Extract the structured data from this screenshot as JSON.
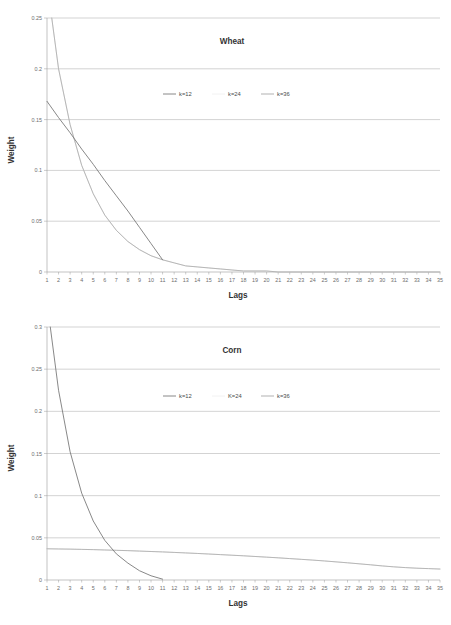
{
  "colors": {
    "series_k12": "#7a7a7a",
    "series_k24": "#d9d9d9",
    "series_k36": "#a8a8a8",
    "gridline": "#a6a6a6",
    "axis": "#9a9a9a",
    "text": "#333333",
    "tick_text": "#6d6d6d",
    "background": "#ffffff"
  },
  "charts": [
    {
      "id": "wheat",
      "title": "Wheat",
      "xlabel": "Lags",
      "ylabel": "Weight",
      "ylim": [
        0,
        0.25
      ],
      "yticks": [
        "0",
        "0.05",
        "0.1",
        "0.15",
        "0.2",
        "0.25"
      ],
      "ytick_values": [
        0,
        0.05,
        0.1,
        0.15,
        0.2,
        0.25
      ],
      "xticks": [
        "1",
        "2",
        "3",
        "4",
        "5",
        "6",
        "7",
        "8",
        "9",
        "10",
        "11",
        "12",
        "13",
        "14",
        "15",
        "16",
        "17",
        "18",
        "19",
        "20",
        "21",
        "22",
        "23",
        "24",
        "25",
        "26",
        "27",
        "28",
        "29",
        "30",
        "31",
        "32",
        "33",
        "34",
        "35"
      ],
      "legend": [
        {
          "label": "k=12",
          "swatch": true
        },
        {
          "label": "k=24",
          "swatch": false
        },
        {
          "label": "k=36",
          "swatch": true
        }
      ]
    },
    {
      "id": "corn",
      "title": "Corn",
      "xlabel": "Lags",
      "ylabel": "Weight",
      "ylim": [
        0,
        0.3
      ],
      "yticks": [
        "0",
        "0.05",
        "0.1",
        "0.15",
        "0.2",
        "0.25",
        "0.3"
      ],
      "ytick_values": [
        0,
        0.05,
        0.1,
        0.15,
        0.2,
        0.25,
        0.3
      ],
      "xticks": [
        "1",
        "2",
        "3",
        "4",
        "5",
        "6",
        "7",
        "8",
        "9",
        "10",
        "11",
        "12",
        "13",
        "14",
        "15",
        "16",
        "17",
        "18",
        "19",
        "20",
        "21",
        "22",
        "23",
        "24",
        "25",
        "26",
        "27",
        "28",
        "29",
        "30",
        "31",
        "32",
        "33",
        "34",
        "35"
      ],
      "legend": [
        {
          "label": "k=12",
          "swatch": true
        },
        {
          "label": "K=24",
          "swatch": false
        },
        {
          "label": "k=36",
          "swatch": true
        }
      ]
    }
  ],
  "chart_data": [
    {
      "type": "line",
      "title": "Wheat",
      "xlabel": "Lags",
      "ylabel": "Weight",
      "ylim": [
        0,
        0.25
      ],
      "xlim": [
        1,
        35
      ],
      "grid": true,
      "legend_position": "inside-top-center",
      "x": [
        1,
        2,
        3,
        4,
        5,
        6,
        7,
        8,
        9,
        10,
        11,
        12,
        13,
        14,
        15,
        16,
        17,
        18,
        19,
        20,
        21,
        22,
        23,
        24,
        25,
        26,
        27,
        28,
        29,
        30,
        31,
        32,
        33,
        34,
        35
      ],
      "series": [
        {
          "name": "k=12",
          "color": "#7a7a7a",
          "values": [
            0.168,
            0.152,
            0.137,
            0.121,
            0.106,
            0.09,
            0.075,
            0.06,
            0.044,
            0.028,
            0.012,
            null,
            null,
            null,
            null,
            null,
            null,
            null,
            null,
            null,
            null,
            null,
            null,
            null,
            null,
            null,
            null,
            null,
            null,
            null,
            null,
            null,
            null,
            null,
            null
          ]
        },
        {
          "name": "k=24",
          "color": "#d9d9d9",
          "values": [
            0.285,
            0.2,
            0.145,
            0.105,
            0.077,
            0.056,
            0.041,
            0.03,
            0.022,
            0.016,
            0.012,
            0.009,
            0.006,
            0.005,
            0.004,
            0.003,
            0.002,
            0.001,
            0.001,
            0.001,
            0.0,
            0.0,
            0.0,
            0.0,
            0.0,
            0.0,
            0.0,
            0.0,
            0.0,
            0.0,
            0.0,
            0.0,
            0.0,
            0.0,
            0.0
          ]
        },
        {
          "name": "k=36",
          "color": "#a8a8a8",
          "values": [
            0.285,
            0.2,
            0.145,
            0.105,
            0.077,
            0.056,
            0.041,
            0.03,
            0.022,
            0.016,
            0.012,
            0.009,
            0.006,
            0.005,
            0.004,
            0.003,
            0.002,
            0.001,
            0.001,
            0.001,
            0.0,
            0.0,
            0.0,
            0.0,
            0.0,
            0.0,
            0.0,
            0.0,
            0.0,
            0.0,
            0.0,
            0.0,
            0.0,
            0.0,
            0.0
          ]
        }
      ]
    },
    {
      "type": "line",
      "title": "Corn",
      "xlabel": "Lags",
      "ylabel": "Weight",
      "ylim": [
        0,
        0.3
      ],
      "xlim": [
        1,
        35
      ],
      "grid": true,
      "legend_position": "inside-top-center",
      "x": [
        1,
        2,
        3,
        4,
        5,
        6,
        7,
        8,
        9,
        10,
        11,
        12,
        13,
        14,
        15,
        16,
        17,
        18,
        19,
        20,
        21,
        22,
        23,
        24,
        25,
        26,
        27,
        28,
        29,
        30,
        31,
        32,
        33,
        34,
        35
      ],
      "series": [
        {
          "name": "k=12",
          "color": "#7a7a7a",
          "values": [
            0.33,
            0.225,
            0.152,
            0.103,
            0.07,
            0.047,
            0.031,
            0.02,
            0.011,
            0.005,
            0.001,
            null,
            null,
            null,
            null,
            null,
            null,
            null,
            null,
            null,
            null,
            null,
            null,
            null,
            null,
            null,
            null,
            null,
            null,
            null,
            null,
            null,
            null,
            null,
            null
          ]
        },
        {
          "name": "K=24",
          "color": "#d9d9d9",
          "values": [
            0.037,
            0.0368,
            0.0366,
            0.0363,
            0.036,
            0.0356,
            0.0352,
            0.0348,
            0.0343,
            0.0338,
            0.0333,
            0.0327,
            0.0321,
            0.0315,
            0.0308,
            0.0301,
            0.0294,
            0.0287,
            0.0279,
            0.0271,
            0.0263,
            0.0254,
            0.0245,
            0.0236,
            0.0226,
            0.0215,
            0.0204,
            0.0192,
            0.018,
            0.0167,
            0.0156,
            0.0147,
            0.014,
            0.0135,
            0.013
          ]
        },
        {
          "name": "k=36",
          "color": "#a8a8a8",
          "values": [
            0.037,
            0.0368,
            0.0366,
            0.0363,
            0.036,
            0.0356,
            0.0352,
            0.0348,
            0.0343,
            0.0338,
            0.0333,
            0.0327,
            0.0321,
            0.0315,
            0.0308,
            0.0301,
            0.0294,
            0.0287,
            0.0279,
            0.0271,
            0.0263,
            0.0254,
            0.0245,
            0.0236,
            0.0226,
            0.0215,
            0.0204,
            0.0192,
            0.018,
            0.0167,
            0.0156,
            0.0147,
            0.014,
            0.0135,
            0.013
          ]
        }
      ]
    }
  ]
}
